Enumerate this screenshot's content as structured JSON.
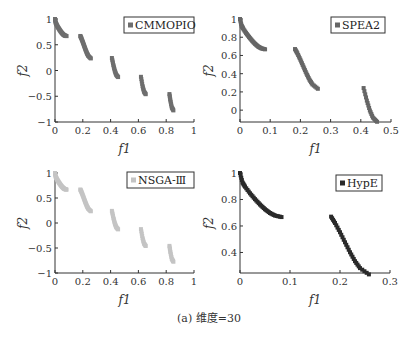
{
  "caption": "(a)  维度=30",
  "chart_data": [
    {
      "type": "scatter",
      "title": "",
      "legend": "CMMOPIO",
      "legend_position": "top-right",
      "color": "#6e6e6e",
      "xlabel": "f1",
      "ylabel": "f2",
      "xlim": [
        0,
        1
      ],
      "ylim": [
        -1,
        1
      ],
      "xticks": [
        0,
        0.2,
        0.4,
        0.6,
        0.8,
        1
      ],
      "xtick_labels": [
        "0",
        "0.2",
        "0.4",
        "0.6",
        "0.8",
        "1"
      ],
      "yticks": [
        -1,
        -0.5,
        0,
        0.5,
        1
      ],
      "ytick_labels": [
        "−1",
        "−0.5",
        "0",
        "0.5",
        "1"
      ],
      "grid": false,
      "points": [
        [
          0,
          1
        ],
        [
          0.005,
          0.9285
        ],
        [
          0.01,
          0.8969
        ],
        [
          0.02,
          0.8468
        ],
        [
          0.03,
          0.8025
        ],
        [
          0.04,
          0.762
        ],
        [
          0.05,
          0.7264
        ],
        [
          0.06,
          0.698
        ],
        [
          0.07,
          0.6788
        ],
        [
          0.083,
          0.6674
        ],
        [
          0.1822,
          0.6704
        ],
        [
          0.19,
          0.6228
        ],
        [
          0.2,
          0.5528
        ],
        [
          0.21,
          0.4768
        ],
        [
          0.22,
          0.4017
        ],
        [
          0.23,
          0.3343
        ],
        [
          0.24,
          0.2819
        ],
        [
          0.2578,
          0.2345
        ],
        [
          0.4093,
          0.2424
        ],
        [
          0.42,
          0.105
        ],
        [
          0.43,
          -0.0036
        ],
        [
          0.44,
          -0.0817
        ],
        [
          0.4539,
          -0.1276
        ],
        [
          0.6183,
          -0.1226
        ],
        [
          0.63,
          -0.3034
        ],
        [
          0.64,
          -0.4086
        ],
        [
          0.6525,
          -0.4601
        ],
        [
          0.8233,
          -0.4577
        ],
        [
          0.83,
          -0.5825
        ],
        [
          0.84,
          -0.7153
        ],
        [
          0.8518,
          -0.7746
        ]
      ]
    },
    {
      "type": "scatter",
      "title": "",
      "legend": "SPEA2",
      "legend_position": "top-right",
      "color": "#666666",
      "xlabel": "f1",
      "ylabel": "f2",
      "xlim": [
        0,
        0.5
      ],
      "ylim": [
        -0.13,
        1
      ],
      "xticks": [
        0,
        0.1,
        0.2,
        0.3,
        0.4,
        0.5
      ],
      "xtick_labels": [
        "0",
        "0.1",
        "0.2",
        "0.3",
        "0.4",
        "0.5"
      ],
      "yticks": [
        0,
        0.2,
        0.4,
        0.6,
        0.8,
        1
      ],
      "ytick_labels": [
        "0",
        "0.2",
        "0.4",
        "0.6",
        "0.8",
        "1"
      ],
      "grid": false,
      "points": [
        [
          0,
          1
        ],
        [
          0.005,
          0.9285
        ],
        [
          0.01,
          0.8969
        ],
        [
          0.02,
          0.8468
        ],
        [
          0.03,
          0.8025
        ],
        [
          0.04,
          0.762
        ],
        [
          0.05,
          0.7264
        ],
        [
          0.06,
          0.698
        ],
        [
          0.07,
          0.6788
        ],
        [
          0.083,
          0.6674
        ],
        [
          0.1822,
          0.6704
        ],
        [
          0.19,
          0.6228
        ],
        [
          0.2,
          0.5528
        ],
        [
          0.21,
          0.4768
        ],
        [
          0.22,
          0.4017
        ],
        [
          0.23,
          0.3343
        ],
        [
          0.24,
          0.2819
        ],
        [
          0.2578,
          0.2345
        ],
        [
          0.4093,
          0.2424
        ],
        [
          0.42,
          0.105
        ],
        [
          0.43,
          -0.0036
        ],
        [
          0.44,
          -0.0817
        ],
        [
          0.4539,
          -0.1276
        ]
      ]
    },
    {
      "type": "scatter",
      "title": "",
      "legend": "NSGA-Ⅲ",
      "legend_position": "top-right",
      "color": "#c4c4c4",
      "xlabel": "f1",
      "ylabel": "f2",
      "xlim": [
        0,
        1
      ],
      "ylim": [
        -1,
        1
      ],
      "xticks": [
        0,
        0.2,
        0.4,
        0.6,
        0.8,
        1
      ],
      "xtick_labels": [
        "0",
        "0.2",
        "0.4",
        "0.6",
        "0.8",
        "1"
      ],
      "yticks": [
        -1,
        -0.5,
        0,
        0.5,
        1
      ],
      "ytick_labels": [
        "−1",
        "−0.5",
        "0",
        "0.5",
        "1"
      ],
      "grid": false,
      "points": [
        [
          0,
          1
        ],
        [
          0.005,
          0.9285
        ],
        [
          0.01,
          0.8969
        ],
        [
          0.02,
          0.8468
        ],
        [
          0.03,
          0.8025
        ],
        [
          0.04,
          0.762
        ],
        [
          0.05,
          0.7264
        ],
        [
          0.06,
          0.698
        ],
        [
          0.07,
          0.6788
        ],
        [
          0.083,
          0.6674
        ],
        [
          0.1822,
          0.6704
        ],
        [
          0.19,
          0.6228
        ],
        [
          0.2,
          0.5528
        ],
        [
          0.21,
          0.4768
        ],
        [
          0.22,
          0.4017
        ],
        [
          0.23,
          0.3343
        ],
        [
          0.24,
          0.2819
        ],
        [
          0.2578,
          0.2345
        ],
        [
          0.4093,
          0.2424
        ],
        [
          0.42,
          0.105
        ],
        [
          0.43,
          -0.0036
        ],
        [
          0.44,
          -0.0817
        ],
        [
          0.4539,
          -0.1276
        ],
        [
          0.6183,
          -0.1226
        ],
        [
          0.63,
          -0.3034
        ],
        [
          0.64,
          -0.4086
        ],
        [
          0.6525,
          -0.4601
        ],
        [
          0.8233,
          -0.4577
        ],
        [
          0.83,
          -0.5825
        ],
        [
          0.84,
          -0.7153
        ],
        [
          0.8518,
          -0.7746
        ]
      ]
    },
    {
      "type": "scatter",
      "title": "",
      "legend": "HypE",
      "legend_position": "top-right",
      "color": "#2a2a2a",
      "xlabel": "f1",
      "ylabel": "f2",
      "xlim": [
        0,
        0.3
      ],
      "ylim": [
        0.245,
        1
      ],
      "xticks": [
        0,
        0.1,
        0.2,
        0.3
      ],
      "xtick_labels": [
        "0",
        "0.1",
        "0.2",
        "0.3"
      ],
      "yticks": [
        0.4,
        0.6,
        0.8,
        1
      ],
      "ytick_labels": [
        "0.4",
        "0.6",
        "0.8",
        "1"
      ],
      "grid": false,
      "points": [
        [
          0,
          1
        ],
        [
          0.005,
          0.9285
        ],
        [
          0.01,
          0.8969
        ],
        [
          0.02,
          0.8468
        ],
        [
          0.03,
          0.8025
        ],
        [
          0.04,
          0.762
        ],
        [
          0.05,
          0.7264
        ],
        [
          0.06,
          0.698
        ],
        [
          0.07,
          0.6788
        ],
        [
          0.083,
          0.6674
        ],
        [
          0.1822,
          0.6704
        ],
        [
          0.19,
          0.6228
        ],
        [
          0.2,
          0.5528
        ],
        [
          0.21,
          0.4768
        ],
        [
          0.22,
          0.4017
        ],
        [
          0.23,
          0.3343
        ],
        [
          0.24,
          0.2819
        ],
        [
          0.2578,
          0.2345
        ]
      ]
    }
  ]
}
